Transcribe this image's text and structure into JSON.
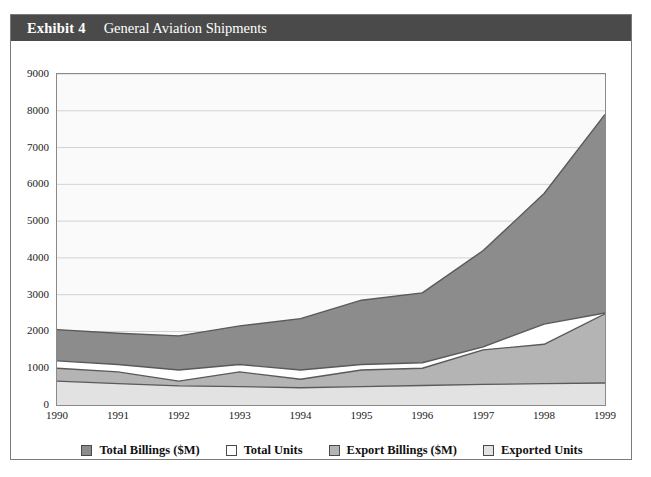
{
  "exhibit": {
    "label": "Exhibit 4",
    "title": "General Aviation Shipments"
  },
  "colors": {
    "header_bg": "#4a4a4a",
    "header_text": "#ffffff",
    "total_billings": "#8c8c8c",
    "total_units": "#ffffff",
    "export_billings": "#b4b4b4",
    "exported_units": "#e2e2e2",
    "plot_bg": "#fafafa",
    "gridline": "#d2d2d2",
    "axis": "#8a8a8a",
    "series_outline": "#5a5a5a"
  },
  "chart_data": {
    "type": "area",
    "title": "General Aviation Shipments",
    "xlabel": "",
    "ylabel": "",
    "stacked": false,
    "grid": true,
    "legend_position": "bottom",
    "xlim": [
      1990,
      1999
    ],
    "ylim": [
      0,
      9000
    ],
    "yticks": [
      0,
      1000,
      2000,
      3000,
      4000,
      5000,
      6000,
      7000,
      8000,
      9000
    ],
    "categories": [
      1990,
      1991,
      1992,
      1993,
      1994,
      1995,
      1996,
      1997,
      1998,
      1999
    ],
    "xticklabels": [
      "1990",
      "1991",
      "1992",
      "1993",
      "1994",
      "1995",
      "1996",
      "1997",
      "1998",
      "1999"
    ],
    "yticklabels": [
      "0",
      "1000",
      "2000",
      "3000",
      "4000",
      "5000",
      "6000",
      "7000",
      "8000",
      "9000"
    ],
    "series": [
      {
        "name": "Total Billings ($M)",
        "color": "#8c8c8c",
        "values": [
          2050,
          1950,
          1880,
          2150,
          2350,
          2850,
          3050,
          4200,
          5750,
          7900
        ]
      },
      {
        "name": "Total Units",
        "color": "#ffffff",
        "values": [
          1200,
          1100,
          950,
          1100,
          950,
          1100,
          1150,
          1580,
          2200,
          2500
        ]
      },
      {
        "name": "Export Billings ($M)",
        "color": "#b4b4b4",
        "values": [
          1000,
          900,
          650,
          900,
          700,
          950,
          1000,
          1500,
          1650,
          2480
        ]
      },
      {
        "name": "Exported Units",
        "color": "#e2e2e2",
        "values": [
          650,
          580,
          520,
          500,
          470,
          500,
          530,
          560,
          580,
          600
        ]
      }
    ]
  },
  "legend": {
    "items": [
      {
        "label": "Total Billings ($M)",
        "color": "#8c8c8c"
      },
      {
        "label": "Total Units",
        "color": "#ffffff"
      },
      {
        "label": "Export Billings ($M)",
        "color": "#b4b4b4"
      },
      {
        "label": "Exported Units",
        "color": "#e2e2e2"
      }
    ]
  }
}
